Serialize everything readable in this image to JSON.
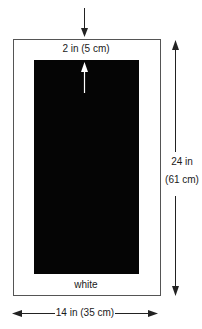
{
  "diagram": {
    "type": "mat-board-dimension-diagram",
    "colors": {
      "background": "#ffffff",
      "mat": "#ffffff",
      "mat_border": "#555555",
      "inner_panel": "#050505",
      "arrow": "#222222",
      "inner_arrow": "#ffffff"
    },
    "labels": {
      "top_margin": "2 in (5 cm)",
      "bottom_label": "white",
      "height_line1": "24 in",
      "height_line2": "(61 cm)",
      "width": "14 in (35 cm)"
    },
    "dimensions": {
      "outer_width_in": 14,
      "outer_width_cm": 35,
      "outer_height_in": 24,
      "outer_height_cm": 61,
      "top_margin_in": 2,
      "top_margin_cm": 5
    },
    "icons": {
      "top_arrow": "arrow-down-icon",
      "inner_arrow": "arrow-up-icon",
      "height_arrow": "double-arrow-vertical-icon",
      "width_arrow": "double-arrow-horizontal-icon"
    }
  }
}
